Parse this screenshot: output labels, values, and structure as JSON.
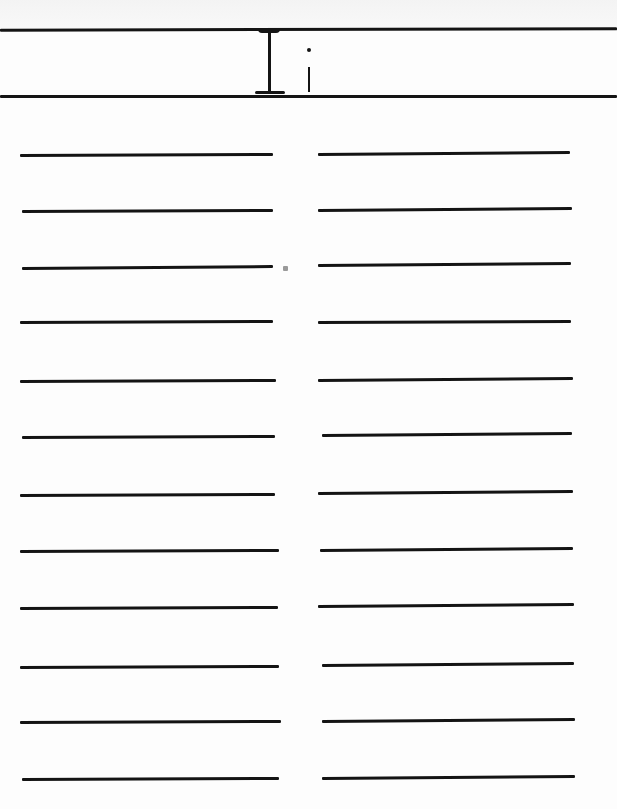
{
  "page": {
    "heading": {
      "uppercase_letter": "I",
      "lowercase_letter": "i",
      "text": "I i"
    },
    "columns": [
      {
        "name": "left",
        "lines": [
          {
            "x1": 20,
            "x2": 273,
            "y1": 155,
            "y2": 154
          },
          {
            "x1": 22,
            "x2": 273,
            "y1": 211,
            "y2": 210
          },
          {
            "x1": 22,
            "x2": 273,
            "y1": 268,
            "y2": 266
          },
          {
            "x1": 20,
            "x2": 273,
            "y1": 322,
            "y2": 321
          },
          {
            "x1": 20,
            "x2": 276,
            "y1": 381,
            "y2": 380
          },
          {
            "x1": 22,
            "x2": 275,
            "y1": 437,
            "y2": 436
          },
          {
            "x1": 20,
            "x2": 275,
            "y1": 495,
            "y2": 494
          },
          {
            "x1": 20,
            "x2": 279,
            "y1": 551,
            "y2": 550
          },
          {
            "x1": 20,
            "x2": 278,
            "y1": 608,
            "y2": 607
          },
          {
            "x1": 20,
            "x2": 279,
            "y1": 667,
            "y2": 666
          },
          {
            "x1": 20,
            "x2": 281,
            "y1": 722,
            "y2": 721
          },
          {
            "x1": 22,
            "x2": 279,
            "y1": 779,
            "y2": 778
          }
        ]
      },
      {
        "name": "right",
        "lines": [
          {
            "x1": 318,
            "x2": 570,
            "y1": 154,
            "y2": 152
          },
          {
            "x1": 318,
            "x2": 572,
            "y1": 210,
            "y2": 208
          },
          {
            "x1": 318,
            "x2": 571,
            "y1": 265,
            "y2": 263
          },
          {
            "x1": 318,
            "x2": 571,
            "y1": 322,
            "y2": 321
          },
          {
            "x1": 318,
            "x2": 573,
            "y1": 380,
            "y2": 378
          },
          {
            "x1": 322,
            "x2": 572,
            "y1": 435,
            "y2": 433
          },
          {
            "x1": 318,
            "x2": 573,
            "y1": 493,
            "y2": 491
          },
          {
            "x1": 320,
            "x2": 573,
            "y1": 550,
            "y2": 548
          },
          {
            "x1": 318,
            "x2": 574,
            "y1": 606,
            "y2": 604
          },
          {
            "x1": 322,
            "x2": 574,
            "y1": 665,
            "y2": 663
          },
          {
            "x1": 322,
            "x2": 575,
            "y1": 721,
            "y2": 719
          },
          {
            "x1": 322,
            "x2": 575,
            "y1": 778,
            "y2": 776
          }
        ]
      }
    ],
    "colors": {
      "ink": "#141414",
      "paper": "#fdfdfd"
    }
  }
}
